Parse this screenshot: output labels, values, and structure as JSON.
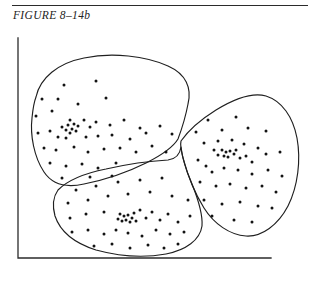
{
  "figure": {
    "caption": "FIGURE 8–14b",
    "rule_color": "#2b2b2b"
  },
  "axes": {
    "color": "#2b2b2b",
    "x_min_px": 18,
    "x_max_px": 271,
    "y_min_px": 38,
    "y_max_px": 258,
    "has_ticks": false,
    "has_tick_labels": false,
    "xlabel": "",
    "ylabel": ""
  },
  "chart_data": {
    "type": "scatter",
    "title": "FIGURE 8–14b",
    "xlabel": "",
    "ylabel": "",
    "xlim": [
      18,
      271
    ],
    "ylim": [
      258,
      38
    ],
    "grid": false,
    "legend": "none",
    "point_color": "#131313",
    "point_radius": 1.5,
    "clusters": [
      {
        "name": "upper-left-cluster",
        "core_center": [
          72,
          128
        ],
        "boundary": "M 36,97 C 40,78 58,63 84,58 C 112,52 146,56 168,66 C 186,74 192,88 188,104 C 185,120 181,131 178,139 C 172,149 160,156 146,163 C 128,172 104,180 84,184 C 66,188 52,184 44,172 C 34,157 30,135 32,118 C 33,108 34,102 36,97 Z",
        "points": [
          [
            64,
            85
          ],
          [
            96,
            81
          ],
          [
            42,
            99
          ],
          [
            58,
            99
          ],
          [
            78,
            104
          ],
          [
            106,
            98
          ],
          [
            36,
            116
          ],
          [
            52,
            111
          ],
          [
            70,
            120
          ],
          [
            74,
            124
          ],
          [
            68,
            125
          ],
          [
            78,
            126
          ],
          [
            66,
            130
          ],
          [
            72,
            129
          ],
          [
            76,
            131
          ],
          [
            70,
            133
          ],
          [
            62,
            127
          ],
          [
            84,
            120
          ],
          [
            90,
            127
          ],
          [
            96,
            122
          ],
          [
            110,
            125
          ],
          [
            124,
            120
          ],
          [
            140,
            128
          ],
          [
            38,
            133
          ],
          [
            50,
            131
          ],
          [
            58,
            137
          ],
          [
            66,
            138
          ],
          [
            86,
            137
          ],
          [
            98,
            136
          ],
          [
            112,
            135
          ],
          [
            130,
            139
          ],
          [
            146,
            133
          ],
          [
            160,
            126
          ],
          [
            172,
            134
          ],
          [
            44,
            148
          ],
          [
            56,
            150
          ],
          [
            74,
            147
          ],
          [
            88,
            152
          ],
          [
            104,
            149
          ],
          [
            120,
            148
          ],
          [
            136,
            152
          ],
          [
            152,
            146
          ],
          [
            166,
            152
          ],
          [
            50,
            163
          ],
          [
            66,
            166
          ],
          [
            82,
            164
          ],
          [
            98,
            168
          ],
          [
            116,
            163
          ],
          [
            62,
            178
          ],
          [
            90,
            177
          ],
          [
            112,
            176
          ]
        ]
      },
      {
        "name": "right-cluster",
        "core_center": [
          228,
          153
        ],
        "boundary": "M 181,141 C 188,131 200,120 216,110 C 234,99 252,92 266,96 C 282,101 293,117 297,138 C 301,160 298,186 288,206 C 278,225 262,237 246,236 C 230,235 214,224 204,208 C 194,192 187,173 183,158 C 181,150 180,145 181,141 Z",
        "points": [
          [
            208,
            120
          ],
          [
            236,
            117
          ],
          [
            196,
            132
          ],
          [
            222,
            130
          ],
          [
            248,
            128
          ],
          [
            266,
            131
          ],
          [
            204,
            143
          ],
          [
            218,
            141
          ],
          [
            232,
            140
          ],
          [
            244,
            144
          ],
          [
            258,
            148
          ],
          [
            222,
            150
          ],
          [
            226,
            152
          ],
          [
            230,
            151
          ],
          [
            234,
            154
          ],
          [
            224,
            156
          ],
          [
            228,
            157
          ],
          [
            236,
            150
          ],
          [
            218,
            155
          ],
          [
            240,
            158
          ],
          [
            214,
            150
          ],
          [
            246,
            156
          ],
          [
            252,
            162
          ],
          [
            266,
            154
          ],
          [
            280,
            152
          ],
          [
            198,
            160
          ],
          [
            206,
            166
          ],
          [
            212,
            172
          ],
          [
            224,
            168
          ],
          [
            238,
            170
          ],
          [
            252,
            174
          ],
          [
            268,
            170
          ],
          [
            282,
            176
          ],
          [
            200,
            182
          ],
          [
            216,
            186
          ],
          [
            230,
            184
          ],
          [
            246,
            188
          ],
          [
            262,
            186
          ],
          [
            276,
            192
          ],
          [
            204,
            200
          ],
          [
            222,
            204
          ],
          [
            240,
            202
          ],
          [
            258,
            206
          ],
          [
            272,
            208
          ],
          [
            212,
            216
          ],
          [
            234,
            220
          ],
          [
            252,
            222
          ]
        ]
      },
      {
        "name": "bottom-cluster",
        "core_center": [
          128,
          217
        ],
        "boundary": "M 58,190 C 68,180 86,173 106,169 C 128,164 150,161 168,160 C 176,159 180,154 181,147 C 182,156 186,170 192,184 C 198,199 203,214 202,226 C 200,240 186,250 166,254 C 144,258 118,256 96,250 C 74,243 60,231 55,216 C 52,205 53,197 58,190 Z",
        "points": [
          [
            76,
            190
          ],
          [
            96,
            186
          ],
          [
            118,
            182
          ],
          [
            140,
            180
          ],
          [
            162,
            178
          ],
          [
            68,
            203
          ],
          [
            88,
            200
          ],
          [
            108,
            196
          ],
          [
            128,
            194
          ],
          [
            150,
            192
          ],
          [
            172,
            196
          ],
          [
            188,
            200
          ],
          [
            70,
            218
          ],
          [
            86,
            214
          ],
          [
            104,
            212
          ],
          [
            120,
            214
          ],
          [
            124,
            216
          ],
          [
            128,
            215
          ],
          [
            132,
            218
          ],
          [
            126,
            220
          ],
          [
            130,
            222
          ],
          [
            122,
            221
          ],
          [
            134,
            213
          ],
          [
            118,
            219
          ],
          [
            136,
            221
          ],
          [
            140,
            210
          ],
          [
            146,
            218
          ],
          [
            152,
            212
          ],
          [
            160,
            220
          ],
          [
            168,
            214
          ],
          [
            178,
            222
          ],
          [
            190,
            216
          ],
          [
            72,
            232
          ],
          [
            88,
            230
          ],
          [
            104,
            234
          ],
          [
            116,
            230
          ],
          [
            128,
            233
          ],
          [
            142,
            236
          ],
          [
            156,
            230
          ],
          [
            170,
            234
          ],
          [
            184,
            232
          ],
          [
            94,
            246
          ],
          [
            112,
            244
          ],
          [
            130,
            248
          ],
          [
            148,
            245
          ],
          [
            164,
            248
          ],
          [
            178,
            244
          ]
        ]
      }
    ],
    "total_points": 146
  }
}
